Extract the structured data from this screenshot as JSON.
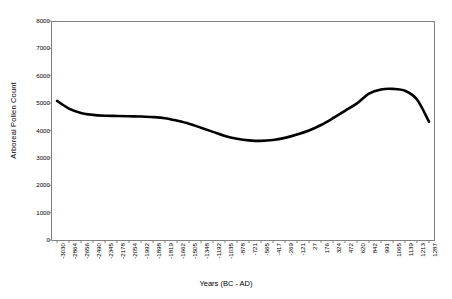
{
  "chart_data": {
    "type": "line",
    "title": "",
    "xlabel": "Years (BC - AD)",
    "ylabel": "Arboreal Pollen Count",
    "ylim": [
      0,
      8000
    ],
    "y_ticks": [
      0,
      1000,
      2000,
      3000,
      4000,
      5000,
      6000,
      7000,
      8000
    ],
    "grid": false,
    "legend": null,
    "categories": [
      "-3030",
      "-2864",
      "-2656",
      "-2490",
      "-2345",
      "-2178",
      "-2054",
      "-1992",
      "-1898",
      "-1819",
      "-1662",
      "-1505",
      "-1348",
      "-1192",
      "-1035",
      "-878",
      "-721",
      "-565",
      "-417",
      "-269",
      "-121",
      "27",
      "176",
      "324",
      "472",
      "620",
      "842",
      "991",
      "1065",
      "1139",
      "1213",
      "1287"
    ],
    "values": [
      5080,
      4800,
      4640,
      4570,
      4540,
      4530,
      4520,
      4510,
      4490,
      4450,
      4360,
      4250,
      4100,
      3950,
      3800,
      3700,
      3640,
      3620,
      3650,
      3730,
      3850,
      4000,
      4200,
      4450,
      4720,
      4990,
      5350,
      5500,
      5520,
      5450,
      5130,
      4320
    ],
    "line_color": "#000000",
    "axis_color": "#808080",
    "background": "#ffffff"
  }
}
